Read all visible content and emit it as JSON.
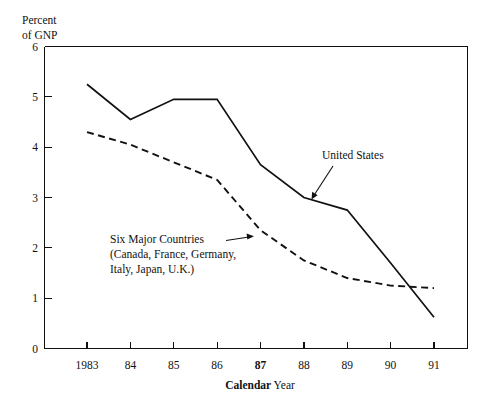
{
  "chart_data": {
    "type": "line",
    "title": "",
    "xlabel": "Calendar Year",
    "ylabel": "Percent of GNP",
    "ylabel_line1": "Percent",
    "ylabel_line2": "of GNP",
    "xlabel_bold_part": "Calendar",
    "xlabel_light_part": " Year",
    "x": [
      1983,
      1984,
      1985,
      1986,
      1987,
      1988,
      1989,
      1990,
      1991
    ],
    "categories": [
      "1983",
      "84",
      "85",
      "86",
      "87",
      "88",
      "89",
      "90",
      "91"
    ],
    "emphasized_category": "87",
    "xlim": [
      1982.4,
      1991.6
    ],
    "ylim": [
      0,
      6
    ],
    "yticks": [
      0,
      1,
      2,
      3,
      4,
      5,
      6
    ],
    "ytick_labels": [
      "0",
      "1",
      "2",
      "3",
      "4",
      "5",
      "6"
    ],
    "grid": false,
    "legend_position": "inline-annotations",
    "series": [
      {
        "name": "United States",
        "style": "solid",
        "color": "#111111",
        "values": [
          5.25,
          4.55,
          4.95,
          4.95,
          3.65,
          3.0,
          2.75,
          1.7,
          0.62
        ]
      },
      {
        "name": "Six Major Countries",
        "style": "dashed",
        "color": "#111111",
        "values": [
          4.3,
          4.05,
          3.7,
          3.35,
          2.35,
          1.75,
          1.4,
          1.25,
          1.2
        ]
      }
    ],
    "annotations": [
      {
        "id": "united-states",
        "text": "United States",
        "target_series": "United States",
        "target_x": 1988.5,
        "target_y": 2.95
      },
      {
        "id": "six-major-countries",
        "line1": "Six Major Countries",
        "line2": "(Canada, France, Germany,",
        "line3": "Italy, Japan, U.K.)",
        "target_series": "Six Major Countries",
        "target_x": 1987.2,
        "target_y": 2.2
      }
    ]
  }
}
